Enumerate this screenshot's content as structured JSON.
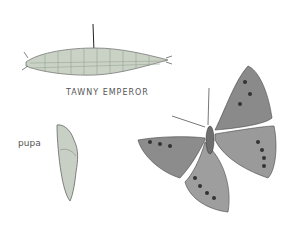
{
  "plate": {
    "title": "TAWNY EMPEROR",
    "labels": {
      "pupa": "pupa"
    },
    "figures": [
      {
        "name": "caterpillar",
        "description": "green striped larva with forked tail"
      },
      {
        "name": "pupa",
        "description": "pale green chrysalis"
      },
      {
        "name": "adult-butterfly",
        "description": "tawny emperor butterfly, wings spread"
      }
    ]
  }
}
